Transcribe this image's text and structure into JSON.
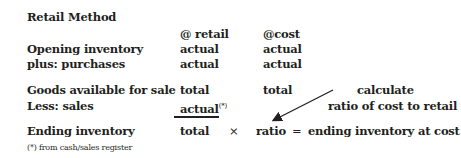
{
  "title": "Retail Method",
  "columns": {
    "retail": "@ retail",
    "cost": "@cost"
  },
  "rows": [
    {
      "label": "Opening inventory",
      "retail": "actual",
      "cost": "actual"
    },
    {
      "label": "plus: purchases",
      "retail": "actual",
      "cost": "actual"
    },
    {
      "label": "Goods available for sale",
      "retail": "total",
      "cost": "total"
    },
    {
      "label": "Less: sales",
      "retail": "actual",
      "retail_note": "(*)"
    },
    {
      "label": "Ending inventory",
      "retail": "total"
    }
  ],
  "formula": {
    "times": "×",
    "ratio": "ratio",
    "equals": "=",
    "result": "ending inventory at cost"
  },
  "callout": {
    "line1": "calculate",
    "line2": "ratio of cost to retail"
  },
  "footnote": "(*) from cash/sales register"
}
